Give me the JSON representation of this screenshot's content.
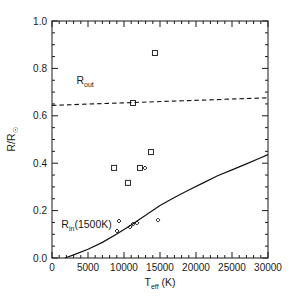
{
  "figure": {
    "background": "#ffffff",
    "frame_color": "#1a1a1a",
    "width": 295,
    "height": 304
  },
  "chart_data": {
    "type": "scatter",
    "title": "",
    "xlabel": "T_eff (K)",
    "xlabel_main": "T",
    "xlabel_sub": "eff",
    "xlabel_unit": " (K)",
    "ylabel": "R/R☉",
    "ylabel_main": "R/R",
    "ylabel_sub": "☉",
    "xlim": [
      0,
      30000
    ],
    "ylim": [
      0.0,
      1.0
    ],
    "xticks": [
      0,
      5000,
      10000,
      15000,
      20000,
      25000,
      30000
    ],
    "xticklabels": [
      "0",
      "5000",
      "10000",
      "15000",
      "20000",
      "25000",
      "30000"
    ],
    "yticks": [
      0.0,
      0.2,
      0.4,
      0.6,
      0.8,
      1.0
    ],
    "yticklabels": [
      "0.0",
      "0.2",
      "0.4",
      "0.6",
      "0.8",
      "1.0"
    ],
    "xminor_per_interval": 5,
    "yminor_per_interval": 4,
    "grid": false,
    "legend": null,
    "annotations": [
      {
        "name": "r-out-label",
        "text": "R_out",
        "main": "R",
        "sub": "out",
        "x": 3400,
        "y": 0.735
      },
      {
        "name": "r-in-label",
        "text": "R_in(1500K)",
        "main": "R",
        "sub": "in",
        "tail": "(1500K)",
        "x": 1300,
        "y": 0.125
      }
    ],
    "series": [
      {
        "name": "observed-squares",
        "marker": "square",
        "marker_size": 5,
        "color": "#2b2b2b",
        "points": [
          {
            "x": 14300,
            "y": 0.865
          },
          {
            "x": 11250,
            "y": 0.654
          },
          {
            "x": 13750,
            "y": 0.447
          },
          {
            "x": 8620,
            "y": 0.38
          },
          {
            "x": 12220,
            "y": 0.38
          },
          {
            "x": 10550,
            "y": 0.317
          }
        ]
      },
      {
        "name": "observed-diamonds",
        "marker": "diamond",
        "marker_size": 4,
        "color": "#2b2b2b",
        "points": [
          {
            "x": 12920,
            "y": 0.38
          },
          {
            "x": 14720,
            "y": 0.16
          },
          {
            "x": 9300,
            "y": 0.156
          },
          {
            "x": 11800,
            "y": 0.148
          },
          {
            "x": 11250,
            "y": 0.143
          },
          {
            "x": 10830,
            "y": 0.131
          },
          {
            "x": 9030,
            "y": 0.114
          }
        ]
      },
      {
        "name": "r-in-1500K-curve",
        "marker": "none",
        "style": "solid",
        "color": "#111111",
        "points": [
          {
            "x": 1800,
            "y": 0.0
          },
          {
            "x": 3000,
            "y": 0.013
          },
          {
            "x": 5000,
            "y": 0.037
          },
          {
            "x": 7000,
            "y": 0.066
          },
          {
            "x": 9000,
            "y": 0.101
          },
          {
            "x": 11000,
            "y": 0.139
          },
          {
            "x": 13000,
            "y": 0.18
          },
          {
            "x": 15000,
            "y": 0.222
          },
          {
            "x": 17000,
            "y": 0.255
          },
          {
            "x": 19000,
            "y": 0.287
          },
          {
            "x": 21000,
            "y": 0.317
          },
          {
            "x": 23000,
            "y": 0.347
          },
          {
            "x": 25000,
            "y": 0.372
          },
          {
            "x": 27000,
            "y": 0.397
          },
          {
            "x": 29000,
            "y": 0.423
          },
          {
            "x": 30000,
            "y": 0.436
          }
        ]
      },
      {
        "name": "r-out-dashed-line",
        "marker": "none",
        "style": "dashed",
        "color": "#111111",
        "points": [
          {
            "x": 0,
            "y": 0.644
          },
          {
            "x": 30000,
            "y": 0.676
          }
        ]
      }
    ]
  }
}
